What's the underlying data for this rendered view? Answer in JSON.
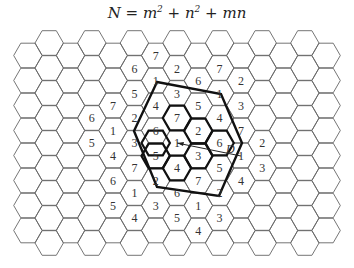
{
  "title": {
    "lhs": "N",
    "formula": "m² + n² + mn"
  },
  "grid": {
    "type": "hexagonal-cellular",
    "orientation": "flat-top",
    "center": [
      177,
      143
    ],
    "dx": 21.3,
    "dy": 25,
    "cols": [
      -8,
      8
    ],
    "rows": [
      -5,
      5
    ],
    "stroke": "#666666"
  },
  "cells": [
    {
      "c": -1,
      "y": 56,
      "t": "7"
    },
    {
      "c": -2,
      "y": 69,
      "t": "6"
    },
    {
      "c": 0,
      "y": 69,
      "t": "2"
    },
    {
      "c": 2,
      "y": 69,
      "t": "7"
    },
    {
      "c": -1,
      "y": 81,
      "t": "1"
    },
    {
      "c": 1,
      "y": 81,
      "t": "6"
    },
    {
      "c": 3,
      "y": 81,
      "t": "2"
    },
    {
      "c": -2,
      "y": 94,
      "t": "5"
    },
    {
      "c": 0,
      "y": 94,
      "t": "3"
    },
    {
      "c": 2,
      "y": 94,
      "t": "1"
    },
    {
      "c": -3,
      "y": 106,
      "t": "7"
    },
    {
      "c": -1,
      "y": 106,
      "t": "4"
    },
    {
      "c": 1,
      "y": 106,
      "t": "5"
    },
    {
      "c": 3,
      "y": 106,
      "t": "3"
    },
    {
      "c": -4,
      "y": 118,
      "t": "6"
    },
    {
      "c": -2,
      "y": 118,
      "t": "2"
    },
    {
      "c": 0,
      "y": 118,
      "t": "7"
    },
    {
      "c": 2,
      "y": 118,
      "t": "4"
    },
    {
      "c": -3,
      "y": 131,
      "t": "1"
    },
    {
      "c": -1,
      "y": 131,
      "t": "6"
    },
    {
      "c": 1,
      "y": 131,
      "t": "2"
    },
    {
      "c": 3,
      "y": 131,
      "t": "7"
    },
    {
      "c": -4,
      "y": 143,
      "t": "5"
    },
    {
      "c": -2,
      "y": 143,
      "t": "3"
    },
    {
      "c": 0,
      "y": 143,
      "t": "1"
    },
    {
      "c": 2,
      "y": 143,
      "t": "6"
    },
    {
      "c": 4,
      "y": 143,
      "t": "2"
    },
    {
      "c": -3,
      "y": 156,
      "t": "4"
    },
    {
      "c": -1,
      "y": 156,
      "t": "5"
    },
    {
      "c": 1,
      "y": 156,
      "t": "3"
    },
    {
      "c": 3,
      "y": 156,
      "t": "1"
    },
    {
      "c": -2,
      "y": 168,
      "t": "7"
    },
    {
      "c": 0,
      "y": 168,
      "t": "4"
    },
    {
      "c": 2,
      "y": 168,
      "t": "5"
    },
    {
      "c": 4,
      "y": 168,
      "t": "3"
    },
    {
      "c": -3,
      "y": 181,
      "t": "6"
    },
    {
      "c": -1,
      "y": 181,
      "t": "2"
    },
    {
      "c": 1,
      "y": 181,
      "t": "7"
    },
    {
      "c": 3,
      "y": 181,
      "t": "4"
    },
    {
      "c": -2,
      "y": 193,
      "t": "1"
    },
    {
      "c": 0,
      "y": 193,
      "t": "6"
    },
    {
      "c": 2,
      "y": 193,
      "t": "2"
    },
    {
      "c": -3,
      "y": 206,
      "t": "5"
    },
    {
      "c": -1,
      "y": 206,
      "t": "3"
    },
    {
      "c": 1,
      "y": 206,
      "t": "1"
    },
    {
      "c": -2,
      "y": 218,
      "t": "4"
    },
    {
      "c": 0,
      "y": 218,
      "t": "5"
    },
    {
      "c": 2,
      "y": 218,
      "t": "3"
    },
    {
      "c": 1,
      "y": 231,
      "t": "4"
    }
  ],
  "cluster_outline": [
    [
      -1,
      143
    ],
    [
      0,
      118
    ],
    [
      1,
      131
    ],
    [
      2,
      143
    ],
    [
      1,
      156
    ],
    [
      0,
      168
    ],
    [
      -1,
      156
    ]
  ],
  "reuse_polygon": [
    [
      157,
      82
    ],
    [
      221,
      94
    ],
    [
      242,
      143
    ],
    [
      219,
      196
    ],
    [
      157,
      187
    ],
    [
      134,
      131
    ]
  ],
  "distance_vector": {
    "from": [
      177,
      143
    ],
    "to": [
      241,
      156
    ],
    "label": "D"
  },
  "colors": {
    "grid": "#666666",
    "outline": "#111111",
    "text": "#333333"
  }
}
